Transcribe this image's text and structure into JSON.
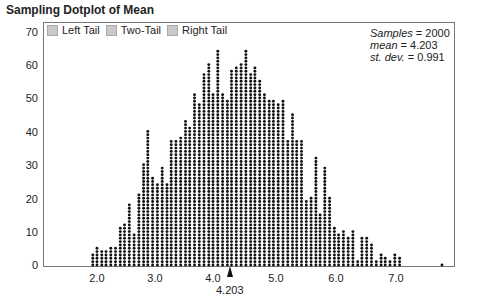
{
  "title": "Sampling Dotplot of Mean",
  "legend": [
    {
      "label": "Left Tail",
      "checked": false
    },
    {
      "label": "Two-Tail",
      "checked": false
    },
    {
      "label": "Right Tail",
      "checked": false
    }
  ],
  "stats": {
    "samples_label": "Samples",
    "samples_value": "2000",
    "mean_label": "mean",
    "mean_value": "4.203",
    "sd_label": "st. dev.",
    "sd_value": "0.991"
  },
  "mean_marker_label": "4.203",
  "chart_data": {
    "type": "dotplot",
    "title": "Sampling Dotplot of Mean",
    "xlabel": "",
    "ylabel": "",
    "yticks": [
      0,
      10,
      20,
      30,
      40,
      50,
      60,
      70
    ],
    "xticks": [
      "2.0",
      "3.0",
      "4.0",
      "5.0",
      "6.0",
      "7.0"
    ],
    "ylim": [
      0,
      70
    ],
    "xlim": [
      1.1,
      7.9
    ],
    "grid": false,
    "legend_position": "top-left",
    "annotations": [
      "Samples = 2000",
      "mean = 4.203",
      "st. dev. = 0.991",
      "4.203 (mean marker)"
    ],
    "x": [
      1.93,
      2.0,
      2.08,
      2.15,
      2.23,
      2.31,
      2.39,
      2.46,
      2.54,
      2.62,
      2.7,
      2.78,
      2.85,
      2.93,
      3.01,
      3.09,
      3.17,
      3.24,
      3.32,
      3.4,
      3.48,
      3.55,
      3.63,
      3.71,
      3.79,
      3.87,
      3.94,
      4.02,
      4.1,
      4.18,
      4.25,
      4.33,
      4.41,
      4.49,
      4.57,
      4.64,
      4.72,
      4.8,
      4.88,
      4.95,
      5.03,
      5.11,
      5.19,
      5.27,
      5.34,
      5.42,
      5.5,
      5.58,
      5.66,
      5.73,
      5.81,
      5.89,
      5.97,
      6.04,
      6.12,
      6.2,
      6.28,
      6.36,
      6.43,
      6.51,
      6.59,
      6.67,
      6.75,
      6.82,
      6.9,
      6.98,
      7.06,
      7.77
    ],
    "values": [
      4,
      6,
      5,
      5,
      6,
      6,
      12,
      13,
      19,
      10,
      22,
      31,
      41,
      27,
      25,
      30,
      25,
      38,
      38,
      39,
      44,
      42,
      52,
      49,
      58,
      61,
      52,
      65,
      52,
      50,
      59,
      60,
      61,
      65,
      58,
      60,
      56,
      52,
      50,
      50,
      49,
      50,
      38,
      46,
      38,
      38,
      20,
      21,
      33,
      16,
      30,
      21,
      12,
      10,
      11,
      9,
      11,
      2,
      9,
      9,
      7,
      2,
      4,
      3,
      2,
      4,
      3,
      1
    ]
  }
}
